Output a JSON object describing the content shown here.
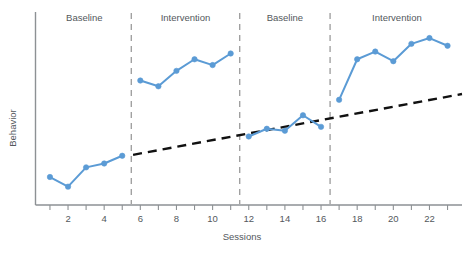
{
  "chart_data": {
    "type": "line",
    "title": "",
    "subtitle": "",
    "xlabel": "Sessions",
    "ylabel": "Behavior",
    "xlim": [
      0.2,
      23.8
    ],
    "ylim": [
      0,
      10
    ],
    "grid": false,
    "legend_position": "none",
    "y_axis_ticks_shown": false,
    "x_tick_values": [
      1,
      2,
      3,
      4,
      5,
      6,
      7,
      8,
      9,
      10,
      11,
      12,
      13,
      14,
      15,
      16,
      17,
      18,
      19,
      20,
      21,
      22,
      23
    ],
    "x_tick_labels": [
      "",
      "2",
      "",
      "4",
      "",
      "6",
      "",
      "8",
      "",
      "10",
      "",
      "12",
      "",
      "14",
      "",
      "16",
      "",
      "18",
      "",
      "20",
      "",
      "22",
      ""
    ],
    "series": [
      {
        "name": "Behavior",
        "color": "#5B9BD5",
        "marker": "circle",
        "broken_between_phases": true,
        "x": [
          1,
          2,
          3,
          4,
          5,
          6,
          7,
          8,
          9,
          10,
          11,
          12,
          13,
          14,
          15,
          16,
          17,
          18,
          19,
          20,
          21,
          22,
          23
        ],
        "values": [
          1.45,
          0.95,
          1.95,
          2.15,
          2.55,
          6.45,
          6.15,
          6.95,
          7.55,
          7.25,
          7.85,
          3.55,
          3.95,
          3.85,
          4.65,
          4.05,
          5.45,
          7.55,
          7.95,
          7.45,
          8.35,
          8.65,
          8.25
        ]
      }
    ],
    "trend_line": {
      "name": "Projected baseline trend",
      "style": "dashed",
      "color": "#111111",
      "x_start": 5.6,
      "y_start": 2.6,
      "x_end": 23.8,
      "y_end": 5.75
    },
    "phases": [
      {
        "label": "Baseline",
        "x_from": 0.2,
        "x_to": 5.5,
        "label_x": 2.9
      },
      {
        "label": "Intervention",
        "x_from": 5.5,
        "x_to": 11.5,
        "label_x": 8.5
      },
      {
        "label": "Baseline",
        "x_from": 11.5,
        "x_to": 16.5,
        "label_x": 14.0
      },
      {
        "label": "Intervention",
        "x_from": 16.5,
        "x_to": 23.8,
        "label_x": 20.2
      }
    ],
    "phase_dividers": [
      5.5,
      11.5,
      16.5
    ],
    "annotations": []
  },
  "axes": {
    "x_title": "Sessions",
    "y_title": "Behavior"
  },
  "phase_labels": {
    "first": "Baseline",
    "second": "Intervention",
    "third": "Baseline",
    "fourth": "Intervention"
  },
  "colors": {
    "series_blue": "#5B9BD5",
    "trend_black": "#111111",
    "divider_gray": "#9b9b9b",
    "axis_gray": "#8d9194",
    "text_gray": "#53585c",
    "background": "#ffffff"
  },
  "tick_labels": {
    "t2": "2",
    "t4": "4",
    "t6": "6",
    "t8": "8",
    "t10": "10",
    "t12": "12",
    "t14": "14",
    "t16": "16",
    "t18": "18",
    "t20": "20",
    "t22": "22"
  }
}
